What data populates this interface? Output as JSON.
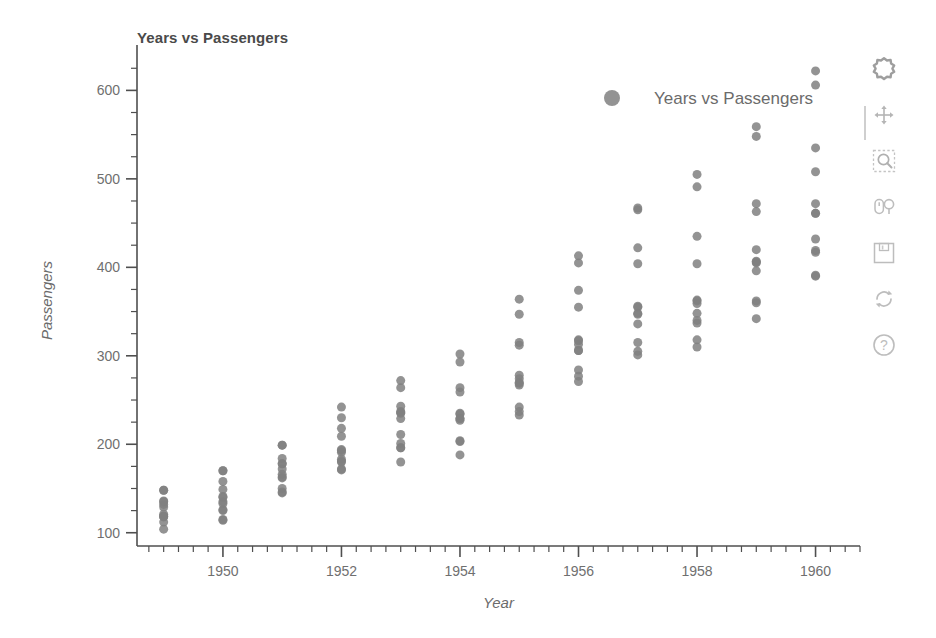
{
  "chart_data": {
    "type": "scatter",
    "title": "Years vs Passengers",
    "xlabel": "Year",
    "ylabel": "Passengers",
    "xlim": [
      1948.55,
      1960.75
    ],
    "ylim": [
      85,
      640
    ],
    "xticks": [
      1950,
      1952,
      1954,
      1956,
      1958,
      1960
    ],
    "xtick_labels": [
      "1950",
      "1952",
      "1954",
      "1956",
      "1958",
      "1960"
    ],
    "x_minor_step": 0.25,
    "yticks": [
      100,
      200,
      300,
      400,
      500,
      600
    ],
    "ytick_labels": [
      "100",
      "200",
      "300",
      "400",
      "500",
      "600"
    ],
    "y_minor_step": 25,
    "grid": false,
    "legend": {
      "entries": [
        {
          "label": "Years vs Passengers",
          "marker": "circle",
          "color": "#808080"
        }
      ],
      "position": "top-right"
    },
    "marker": {
      "shape": "circle",
      "color": "#808080",
      "size": 9,
      "alpha": 0.85
    },
    "series": [
      {
        "name": "Years vs Passengers",
        "x": [
          1949,
          1949,
          1949,
          1949,
          1949,
          1949,
          1949,
          1949,
          1949,
          1949,
          1949,
          1949,
          1950,
          1950,
          1950,
          1950,
          1950,
          1950,
          1950,
          1950,
          1950,
          1950,
          1950,
          1950,
          1951,
          1951,
          1951,
          1951,
          1951,
          1951,
          1951,
          1951,
          1951,
          1951,
          1951,
          1951,
          1952,
          1952,
          1952,
          1952,
          1952,
          1952,
          1952,
          1952,
          1952,
          1952,
          1952,
          1952,
          1953,
          1953,
          1953,
          1953,
          1953,
          1953,
          1953,
          1953,
          1953,
          1953,
          1953,
          1953,
          1954,
          1954,
          1954,
          1954,
          1954,
          1954,
          1954,
          1954,
          1954,
          1954,
          1954,
          1954,
          1955,
          1955,
          1955,
          1955,
          1955,
          1955,
          1955,
          1955,
          1955,
          1955,
          1955,
          1955,
          1956,
          1956,
          1956,
          1956,
          1956,
          1956,
          1956,
          1956,
          1956,
          1956,
          1956,
          1956,
          1957,
          1957,
          1957,
          1957,
          1957,
          1957,
          1957,
          1957,
          1957,
          1957,
          1957,
          1957,
          1958,
          1958,
          1958,
          1958,
          1958,
          1958,
          1958,
          1958,
          1958,
          1958,
          1958,
          1958,
          1959,
          1959,
          1959,
          1959,
          1959,
          1959,
          1959,
          1959,
          1959,
          1959,
          1959,
          1959,
          1960,
          1960,
          1960,
          1960,
          1960,
          1960,
          1960,
          1960,
          1960,
          1960,
          1960,
          1960
        ],
        "y": [
          112,
          118,
          132,
          129,
          121,
          135,
          148,
          148,
          136,
          119,
          104,
          118,
          115,
          126,
          141,
          135,
          125,
          149,
          170,
          170,
          158,
          133,
          114,
          140,
          145,
          150,
          178,
          163,
          172,
          178,
          199,
          199,
          184,
          162,
          146,
          166,
          171,
          180,
          193,
          181,
          183,
          218,
          230,
          242,
          209,
          191,
          172,
          194,
          196,
          196,
          236,
          235,
          229,
          243,
          264,
          272,
          237,
          211,
          180,
          201,
          204,
          188,
          235,
          227,
          234,
          264,
          302,
          293,
          259,
          229,
          203,
          229,
          242,
          233,
          267,
          269,
          270,
          315,
          364,
          347,
          312,
          274,
          237,
          278,
          284,
          277,
          317,
          313,
          318,
          374,
          413,
          405,
          355,
          306,
          271,
          306,
          315,
          301,
          356,
          348,
          355,
          422,
          465,
          467,
          404,
          347,
          305,
          336,
          340,
          318,
          362,
          348,
          363,
          435,
          491,
          505,
          404,
          359,
          310,
          337,
          360,
          342,
          406,
          396,
          420,
          472,
          548,
          559,
          463,
          407,
          362,
          405,
          417,
          391,
          419,
          461,
          472,
          535,
          622,
          606,
          508,
          461,
          390,
          432
        ]
      }
    ]
  },
  "toolbar": {
    "tools": [
      {
        "name": "bokeh-logo-icon",
        "label": "Bokeh"
      },
      {
        "name": "pan-tool-icon",
        "label": "Pan"
      },
      {
        "name": "box-zoom-tool-icon",
        "label": "Box Zoom"
      },
      {
        "name": "wheel-zoom-tool-icon",
        "label": "Wheel Zoom"
      },
      {
        "name": "save-tool-icon",
        "label": "Save"
      },
      {
        "name": "reset-tool-icon",
        "label": "Reset"
      },
      {
        "name": "help-tool-icon",
        "label": "Help"
      }
    ]
  },
  "colors": {
    "marker": "#808080",
    "axis": "#4f4f4f",
    "text": "#6b6b6b",
    "title": "#4a4a4a",
    "background": "#ffffff",
    "toolbar_icon": "#b9b9b9"
  }
}
